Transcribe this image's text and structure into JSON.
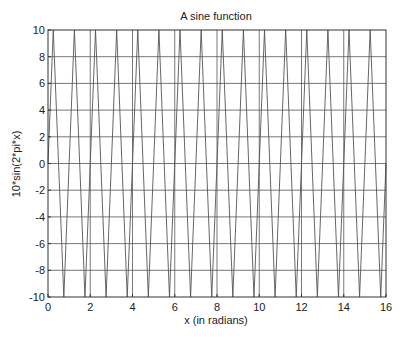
{
  "chart_data": {
    "type": "line",
    "title": "A sine function",
    "xlabel": "x  (in radians)",
    "ylabel": "10*sin(2*pi*x)",
    "xlim": [
      0,
      16
    ],
    "ylim": [
      -10,
      10
    ],
    "xticks": [
      0,
      2,
      4,
      6,
      8,
      10,
      12,
      14,
      16
    ],
    "yticks": [
      -10,
      -8,
      -6,
      -4,
      -2,
      0,
      2,
      4,
      6,
      8,
      10
    ],
    "grid": true,
    "legend": null,
    "series": [
      {
        "name": "10*sin(2*pi*x)",
        "function": "10*sin(2*pi*x)",
        "amplitude": 10,
        "period": 1,
        "x_start": 0,
        "x_end": 16,
        "color": "#555555"
      }
    ]
  },
  "colors": {
    "background": "#ffffff",
    "axes": "#333333",
    "grid": "#555555",
    "line": "#555555"
  }
}
